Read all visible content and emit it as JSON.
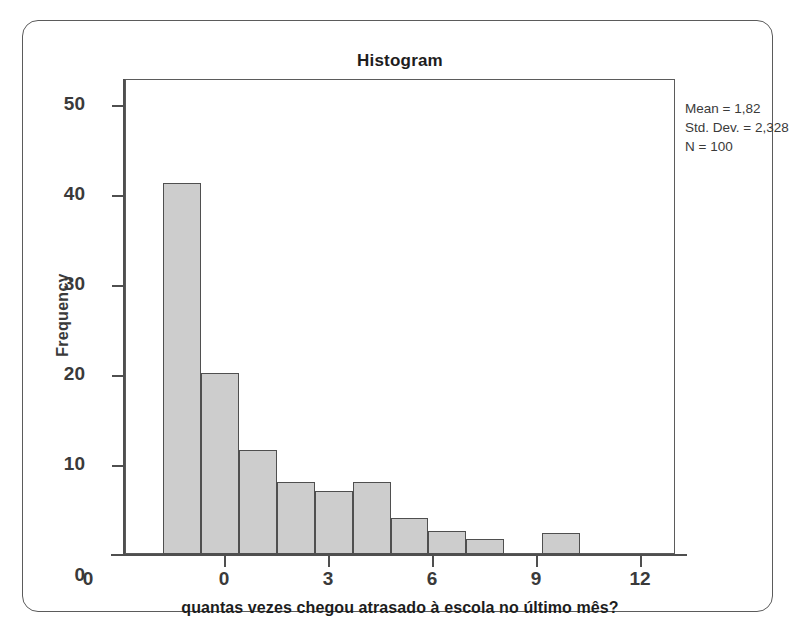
{
  "chart_data": {
    "type": "bar",
    "title": "Histogram",
    "xlabel": "quantas vezes chegou atrasado à escola no último mês?",
    "ylabel": "Frequency",
    "xlim": [
      -1.5,
      13.0
    ],
    "ylim": [
      0,
      52.5
    ],
    "grid": false,
    "legend": null,
    "x_ticks": [
      "0",
      "3",
      "6",
      "9",
      "12"
    ],
    "x_tick_values": [
      0,
      3,
      6,
      9,
      12
    ],
    "y_ticks": [
      "0",
      "10",
      "20",
      "30",
      "40",
      "50"
    ],
    "y_tick_values": [
      0,
      10,
      20,
      30,
      40,
      50
    ],
    "y_axis_origin_label": "0",
    "bin_width": 1,
    "bins": [
      {
        "left": -0.5,
        "right": 0.5,
        "value": 41
      },
      {
        "left": 0.5,
        "right": 1.5,
        "value": 20
      },
      {
        "left": 1.5,
        "right": 2.5,
        "value": 11.5
      },
      {
        "left": 2.5,
        "right": 3.5,
        "value": 8
      },
      {
        "left": 3.5,
        "right": 4.5,
        "value": 7
      },
      {
        "left": 4.5,
        "right": 5.5,
        "value": 8
      },
      {
        "left": 5.5,
        "right": 6.5,
        "value": 4
      },
      {
        "left": 6.5,
        "right": 7.5,
        "value": 2.5
      },
      {
        "left": 7.5,
        "right": 8.5,
        "value": 1.7
      },
      {
        "left": 9.5,
        "right": 10.5,
        "value": 2.3
      }
    ],
    "categories": [
      "0",
      "1",
      "2",
      "3",
      "4",
      "5",
      "6",
      "7",
      "8",
      "10"
    ],
    "values": [
      41,
      20,
      11.5,
      8,
      7,
      8,
      4,
      2.5,
      1.7,
      2.3
    ],
    "annotations": {
      "mean_label": "Mean = 1,82",
      "std_dev_label": "Std. Dev. = 2,328",
      "n_label": "N = 100"
    },
    "colors": {
      "bar_fill": "#cdcdcd",
      "bar_border": "#4f4f4f",
      "axis": "#4f4f4f",
      "text": "#3a3a3a",
      "frame": "#5b5b5b"
    }
  }
}
